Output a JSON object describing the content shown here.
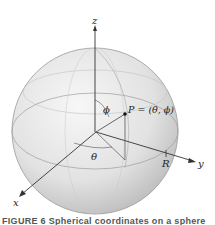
{
  "figure": {
    "labels": {
      "z_axis": "z",
      "y_axis": "y",
      "x_axis": "x",
      "phi": "ϕ",
      "theta": "θ",
      "point": "P = (θ, ϕ)",
      "radius": "R"
    },
    "caption": "FIGURE 6  Spherical coordinates on a sphere",
    "colors": {
      "sphere_light": "#f4f4f4",
      "sphere_dark": "#b9b9b9",
      "axis": "#333333",
      "grid_line": "#a8a8a8"
    }
  }
}
